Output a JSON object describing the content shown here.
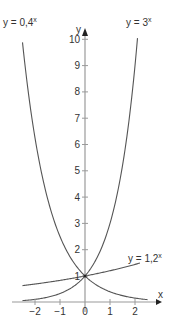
{
  "chart_data": {
    "type": "line",
    "title": "",
    "xlabel": "x",
    "ylabel": "y",
    "xlim": [
      -2.5,
      2.5
    ],
    "ylim": [
      0,
      10.5
    ],
    "grid": false,
    "x_ticks": [
      -2,
      -1,
      0,
      1,
      2
    ],
    "x_tick_labels": [
      "−2",
      "−1",
      "0",
      "1",
      "2"
    ],
    "y_ticks": [
      1,
      2,
      3,
      4,
      5,
      6,
      7,
      8,
      9,
      10
    ],
    "y_tick_labels": [
      "1",
      "2",
      "3",
      "4",
      "5",
      "6",
      "7",
      "8",
      "9",
      "10"
    ],
    "series": [
      {
        "name": "y = 3^x",
        "label_base": "y = 3",
        "label_exp": "x",
        "base": 3,
        "x": [
          -2.5,
          -2,
          -1,
          0,
          1,
          2,
          2.1
        ],
        "values": [
          0.06,
          0.11,
          0.33,
          1,
          3,
          9,
          10.05
        ]
      },
      {
        "name": "y = 0,4^x",
        "label_base": "y = 0,4",
        "label_exp": "x",
        "base": 0.4,
        "x": [
          -2.5,
          -2,
          -1,
          0,
          1,
          2,
          2.5
        ],
        "values": [
          9.88,
          6.25,
          2.5,
          1,
          0.4,
          0.16,
          0.1
        ]
      },
      {
        "name": "y = 1,2^x",
        "label_base": "y = 1,2",
        "label_exp": "x",
        "base": 1.2,
        "x": [
          -2.5,
          -2,
          -1,
          0,
          1,
          2,
          2.2
        ],
        "values": [
          0.63,
          0.69,
          0.83,
          1,
          1.2,
          1.44,
          1.49
        ]
      }
    ],
    "annotations": [
      {
        "text": "1",
        "x": 0,
        "y": 1,
        "note": "common intersection point (0, 1)"
      }
    ]
  },
  "colors": {
    "curve": "#555555",
    "axis": "#9a9a9a",
    "text": "#333333"
  }
}
